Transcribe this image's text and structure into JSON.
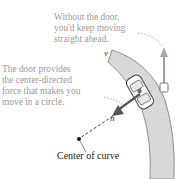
{
  "diagram": {
    "caption_top": {
      "lines": [
        "Without the door,",
        "you'd keep moving",
        "straight ahead."
      ]
    },
    "caption_left": {
      "lines": [
        "The door provides",
        "the center-directed",
        "force that makes you",
        "move in a circle."
      ]
    },
    "center_label": "Center of curve",
    "velocity_label": "v⃗",
    "normal_label": "n⃗",
    "colors": {
      "road": "#d6d6d6",
      "road_edge": "#7a7a7a",
      "caption": "#9a9a9a",
      "arrow": "#555555",
      "text": "#222222"
    }
  }
}
